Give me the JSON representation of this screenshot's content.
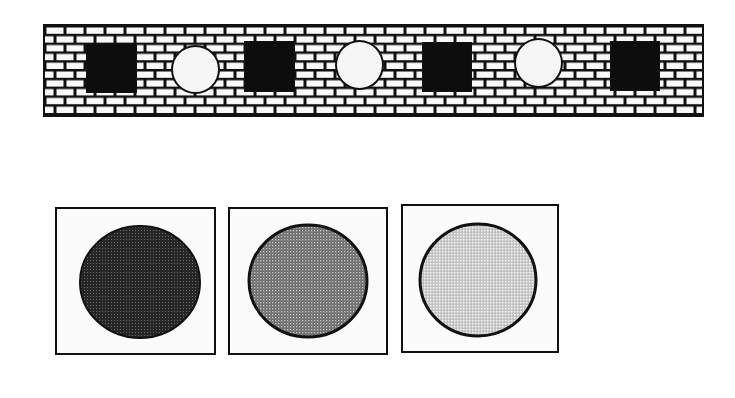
{
  "figure": {
    "wall": {
      "description": "brick wall strip with alternating square and circular openings",
      "colors": {
        "mortar": "#111111",
        "brick": "#fafafa"
      },
      "openings": [
        {
          "shape": "square",
          "fill": "#0d0d0d"
        },
        {
          "shape": "circle",
          "fill": "#f6f6f6"
        },
        {
          "shape": "square",
          "fill": "#0d0d0d"
        },
        {
          "shape": "circle",
          "fill": "#f6f6f6"
        },
        {
          "shape": "square",
          "fill": "#0d0d0d"
        },
        {
          "shape": "circle",
          "fill": "#f6f6f6"
        },
        {
          "shape": "square",
          "fill": "#0d0d0d"
        }
      ]
    },
    "swatches": [
      {
        "label": "dark",
        "fill": "#2a2a2a",
        "dot": "#6a6a6a"
      },
      {
        "label": "medium",
        "fill": "#6e6e6e",
        "dot": "#bdbdbd"
      },
      {
        "label": "light",
        "fill": "#c4c4c4",
        "dot": "#f2f2f2"
      }
    ]
  }
}
